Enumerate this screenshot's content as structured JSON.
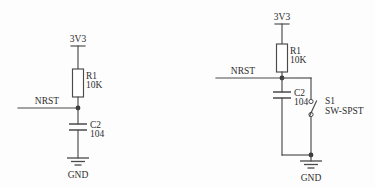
{
  "diagram": {
    "background_color": "#fdfdfd",
    "line_color": "#4a4a4a",
    "text_color": "#2e2e2e"
  },
  "circuits": [
    {
      "id": "left",
      "name": "nrst-rc-reset",
      "power_label": "3V3",
      "net_label": "NRST",
      "ground_label": "GND",
      "components": [
        {
          "type": "resistor",
          "designator": "R1",
          "value": "10K"
        },
        {
          "type": "capacitor",
          "designator": "C2",
          "value": "104"
        }
      ]
    },
    {
      "id": "right",
      "name": "nrst-rc-reset-with-switch",
      "power_label": "3V3",
      "net_label": "NRST",
      "ground_label": "GND",
      "components": [
        {
          "type": "resistor",
          "designator": "R1",
          "value": "10K"
        },
        {
          "type": "capacitor",
          "designator": "C2",
          "value": "104"
        },
        {
          "type": "switch",
          "designator": "S1",
          "value": "SW-SPST"
        }
      ]
    }
  ]
}
